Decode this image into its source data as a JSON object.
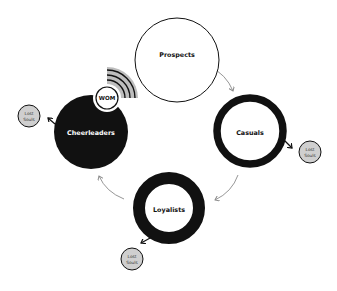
{
  "diagram": {
    "type": "customer-lifecycle-loop",
    "colors": {
      "ink": "#111111",
      "flow_arrow": "#8a8a8a",
      "lost_souls_fill": "#cfcfcf",
      "wom_waves_bg": "#bdbdbd",
      "background": "#ffffff"
    },
    "stages": [
      {
        "id": "prospects",
        "label": "Prospects",
        "style": "thin-outline"
      },
      {
        "id": "casuals",
        "label": "Casuals",
        "style": "medium-ring"
      },
      {
        "id": "loyalists",
        "label": "Loyalists",
        "style": "thick-ring"
      },
      {
        "id": "cheerleaders",
        "label": "Cheerleaders",
        "style": "filled"
      }
    ],
    "flows": [
      {
        "from": "Prospects",
        "to": "Casuals"
      },
      {
        "from": "Casuals",
        "to": "Loyalists"
      },
      {
        "from": "Loyalists",
        "to": "Cheerleaders"
      }
    ],
    "wom_badge": {
      "label": "WOM",
      "icon": "broadcast-waves-icon"
    },
    "lost_souls": [
      {
        "from": "Cheerleaders",
        "line1": "Lost",
        "line2": "Souls"
      },
      {
        "from": "Casuals",
        "line1": "Lost",
        "line2": "Souls"
      },
      {
        "from": "Loyalists",
        "line1": "Lost",
        "line2": "Souls"
      }
    ]
  }
}
